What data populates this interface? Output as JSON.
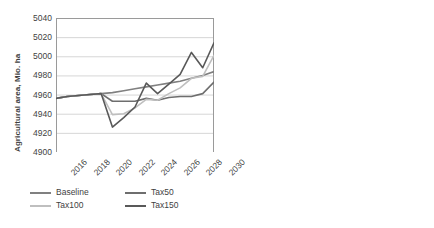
{
  "chart_data": [
    {
      "type": "line",
      "title": "",
      "xlabel": "",
      "ylabel": "Agricultural area, Mio. ha",
      "ylim": [
        4900,
        5040
      ],
      "yticks": [
        4900,
        4920,
        4940,
        4960,
        4980,
        5000,
        5020,
        5040
      ],
      "xticks": [
        "2016",
        "2018",
        "2020",
        "2022",
        "2024",
        "2026",
        "2028",
        "2030"
      ],
      "x": [
        2016,
        2017,
        2018,
        2019,
        2020,
        2021,
        2022,
        2023,
        2024,
        2025,
        2026,
        2027,
        2028,
        2029,
        2030
      ],
      "grid": true,
      "legend_position": "bottom",
      "series": [
        {
          "name": "Baseline",
          "color": "#808080",
          "values": [
            4956,
            4958,
            4959,
            4960,
            4961,
            4962,
            4964,
            4966,
            4968,
            4970,
            4972,
            4974,
            4977,
            4980,
            4984
          ]
        },
        {
          "name": "Tax50",
          "color": "#6e6e6e",
          "values": [
            4956,
            4958,
            4959,
            4960,
            4961,
            4953,
            4953,
            4953,
            4956,
            4954,
            4957,
            4958,
            4958,
            4961,
            4973
          ]
        },
        {
          "name": "Tax100",
          "color": "#bfbfbf",
          "values": [
            4956,
            4958,
            4959,
            4960,
            4961,
            4939,
            4940,
            4946,
            4955,
            4954,
            4961,
            4967,
            4977,
            4979,
            5001
          ]
        },
        {
          "name": "Tax150",
          "color": "#595959",
          "values": [
            4956,
            4958,
            4959,
            4960,
            4961,
            4926,
            4936,
            4947,
            4972,
            4961,
            4971,
            4981,
            5004,
            4988,
            5014
          ]
        }
      ]
    },
    {
      "type": "bar",
      "title": "",
      "xlabel": "",
      "ylabel": "Change in agricultural area Mio. ha",
      "ylim": [
        -20,
        40
      ],
      "yticks": [
        -20,
        -10,
        0,
        10,
        20,
        30,
        40
      ],
      "categories": [
        "Tax50",
        "Tax100",
        "Tax150"
      ],
      "grid": true,
      "stacked": true,
      "legend_position": "bottom",
      "series": [
        {
          "name": "Africa",
          "color": "#9e9e9e",
          "values": [
            5.5,
            20.0,
            25.5
          ]
        },
        {
          "name": "Asia",
          "color": "#b5b5b5",
          "values": [
            0.0,
            0.0,
            5.5
          ]
        },
        {
          "name": "Europe",
          "color": "#d9d9d9",
          "values": [
            -10.0,
            0.0,
            0.0
          ]
        },
        {
          "name": "South America",
          "color": "#c4c4c4",
          "values": [
            0.0,
            0.0,
            0.0
          ]
        },
        {
          "name": "North America",
          "color": "#a8a8a8",
          "values": [
            -7.5,
            -3.5,
            -1.5
          ]
        },
        {
          "name": "Oceania",
          "color": "#cccccc",
          "values": [
            0.0,
            0.0,
            0.0
          ]
        }
      ],
      "bar_totals_positive": [
        5.5,
        20.0,
        31.0
      ],
      "bar_totals_negative": [
        -17.5,
        -3.5,
        -1.5
      ]
    }
  ],
  "left_chart": {
    "y_axis_label": "Agricultural area, Mio. ha",
    "y_ticks": [
      "5040",
      "5020",
      "5000",
      "4980",
      "4960",
      "4940",
      "4920",
      "4900"
    ],
    "x_ticks": [
      "2016",
      "2018",
      "2020",
      "2022",
      "2024",
      "2026",
      "2028",
      "2030"
    ],
    "legend": [
      {
        "label": "Baseline",
        "color": "#808080"
      },
      {
        "label": "Tax50",
        "color": "#6e6e6e"
      },
      {
        "label": "Tax100",
        "color": "#bfbfbf"
      },
      {
        "label": "Tax150",
        "color": "#595959"
      }
    ]
  },
  "right_chart": {
    "y_axis_label": "Change in agricultural area Mio. ha",
    "y_ticks": [
      "40",
      "30",
      "20",
      "10",
      "0",
      "-10",
      "-20"
    ],
    "x_ticks": [
      "Tax50",
      "Tax100",
      "Tax150"
    ],
    "legend": [
      {
        "label": "Africa",
        "color": "#9e9e9e"
      },
      {
        "label": "Asia",
        "color": "#b5b5b5"
      },
      {
        "label": "Europe",
        "color": "#d9d9d9"
      },
      {
        "label": "South America",
        "color": "#c4c4c4"
      },
      {
        "label": "North America",
        "color": "#a8a8a8"
      },
      {
        "label": "Oceania",
        "color": "#cccccc"
      }
    ]
  }
}
